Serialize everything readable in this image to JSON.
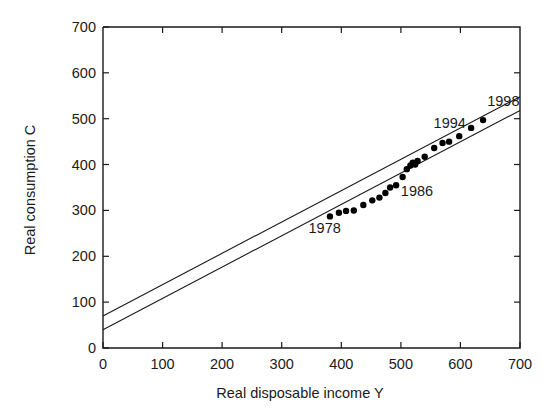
{
  "chart_data": {
    "type": "scatter",
    "title": "",
    "xlabel": "Real disposable income Y",
    "ylabel": "Real consumption C",
    "xlim": [
      0,
      700
    ],
    "ylim": [
      0,
      700
    ],
    "xticks": [
      0,
      100,
      200,
      300,
      400,
      500,
      600,
      700
    ],
    "yticks": [
      0,
      100,
      200,
      300,
      400,
      500,
      600,
      700
    ],
    "xtick_labels": [
      "0",
      "100",
      "200",
      "300",
      "400",
      "500",
      "600",
      "700"
    ],
    "ytick_labels": [
      "0",
      "100",
      "200",
      "300",
      "400",
      "500",
      "600",
      "700"
    ],
    "grid": false,
    "legend": "none",
    "points": [
      {
        "x": 381,
        "y": 287,
        "label": "1978"
      },
      {
        "x": 396,
        "y": 295,
        "label": ""
      },
      {
        "x": 408,
        "y": 299,
        "label": ""
      },
      {
        "x": 421,
        "y": 300,
        "label": ""
      },
      {
        "x": 437,
        "y": 312,
        "label": ""
      },
      {
        "x": 452,
        "y": 322,
        "label": ""
      },
      {
        "x": 464,
        "y": 328,
        "label": ""
      },
      {
        "x": 474,
        "y": 338,
        "label": ""
      },
      {
        "x": 482,
        "y": 350,
        "label": "1986"
      },
      {
        "x": 492,
        "y": 355,
        "label": ""
      },
      {
        "x": 503,
        "y": 373,
        "label": ""
      },
      {
        "x": 510,
        "y": 390,
        "label": ""
      },
      {
        "x": 516,
        "y": 398,
        "label": ""
      },
      {
        "x": 520,
        "y": 404,
        "label": ""
      },
      {
        "x": 524,
        "y": 400,
        "label": ""
      },
      {
        "x": 528,
        "y": 408,
        "label": ""
      },
      {
        "x": 540,
        "y": 417,
        "label": ""
      },
      {
        "x": 556,
        "y": 436,
        "label": ""
      },
      {
        "x": 570,
        "y": 447,
        "label": "1994"
      },
      {
        "x": 581,
        "y": 450,
        "label": ""
      },
      {
        "x": 598,
        "y": 462,
        "label": ""
      },
      {
        "x": 618,
        "y": 480,
        "label": ""
      },
      {
        "x": 638,
        "y": 497,
        "label": "1998"
      }
    ],
    "series": [
      {
        "name": "upper-fit-line",
        "type": "line",
        "x": [
          0,
          700
        ],
        "y": [
          70,
          548
        ]
      },
      {
        "name": "lower-fit-line",
        "type": "line",
        "x": [
          0,
          700
        ],
        "y": [
          40,
          518
        ]
      }
    ],
    "annotations": [
      {
        "text": "1978",
        "x": 345,
        "y": 250
      },
      {
        "text": "1986",
        "x": 500,
        "y": 332
      },
      {
        "text": "1994",
        "x": 555,
        "y": 480
      },
      {
        "text": "1998",
        "x": 645,
        "y": 527
      }
    ]
  },
  "axes": {
    "x_title": "Real disposable income Y",
    "y_title": "Real consumption C"
  }
}
